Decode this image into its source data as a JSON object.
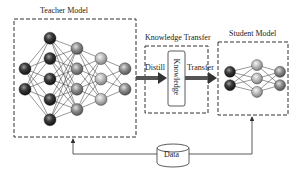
{
  "diagram": {
    "teacher": {
      "title": "Teacher Model",
      "layers": [
        2,
        5,
        4,
        3,
        2
      ]
    },
    "transfer": {
      "title": "Knowledge Transfer",
      "knowledge_label": "Knowledge",
      "distill_label": "Distill",
      "transfer_label": "Transfer"
    },
    "student": {
      "title": "Student Model",
      "layers": [
        2,
        3,
        2
      ]
    },
    "data": {
      "label": "Data"
    },
    "colors": {
      "dark_node": "#2a2a2a",
      "mid_node": "#7a7a7a",
      "light_node": "#b8b8b8",
      "arrow": "#555555",
      "border": "#333333"
    }
  }
}
